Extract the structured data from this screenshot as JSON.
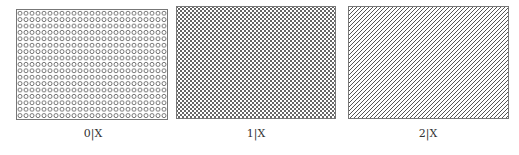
{
  "figures": [
    {
      "id": "0",
      "label": "0|X",
      "pattern": "circles",
      "pattern_description": "grid of small circles",
      "stroke_color": "#666666"
    },
    {
      "id": "1",
      "label": "1|X",
      "pattern": "crosshatch",
      "pattern_description": "dense diagonal crosshatch",
      "stroke_color": "#555555"
    },
    {
      "id": "2",
      "label": "2|X",
      "pattern": "diagonal",
      "pattern_description": "dense diagonal lines",
      "stroke_color": "#555555"
    }
  ]
}
